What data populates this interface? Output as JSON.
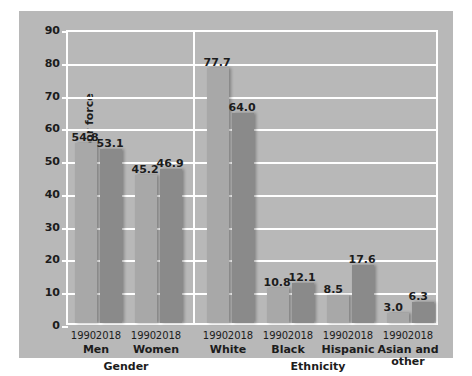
{
  "chart_data": {
    "type": "bar",
    "title": "",
    "xlabel": "",
    "ylabel": "Percentage of labor force",
    "ylim": [
      0,
      90
    ],
    "ytick_step": 10,
    "yticks": [
      "0",
      "10",
      "20",
      "30",
      "40",
      "50",
      "60",
      "70",
      "80",
      "90"
    ],
    "grid": true,
    "legend": "none",
    "series": [
      {
        "name": "1990",
        "color": "#a8a8a8"
      },
      {
        "name": "2018",
        "color": "#8a8a8a"
      }
    ],
    "sections": [
      {
        "name": "Gender",
        "categories": [
          {
            "label": "Men",
            "values": [
              54.8,
              53.1
            ]
          },
          {
            "label": "Women",
            "values": [
              45.2,
              46.9
            ]
          }
        ]
      },
      {
        "name": "Ethnicity",
        "categories": [
          {
            "label": "White",
            "values": [
              77.7,
              64.0
            ]
          },
          {
            "label": "Black",
            "values": [
              10.8,
              12.1
            ]
          },
          {
            "label": "Hispanic",
            "values": [
              8.5,
              17.6
            ]
          },
          {
            "label": "Asian and other",
            "values": [
              3.0,
              6.3
            ]
          }
        ]
      }
    ],
    "value_labels": [
      "54.8",
      "53.1",
      "45.2",
      "46.9",
      "77.7",
      "64.0",
      "10.8",
      "12.1",
      "8.5",
      "17.6",
      "3.0",
      "6.3"
    ],
    "year_labels": [
      "1990",
      "2018"
    ],
    "colors": {
      "figure_background": "#ffffff",
      "panel_background": "#b8b8b8",
      "grid": "#ffffff",
      "text": "#1c1c1c",
      "bar_1990": "#a8a8a8",
      "bar_2018": "#8a8a8a"
    }
  }
}
